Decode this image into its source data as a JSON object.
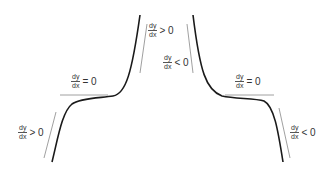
{
  "diagram": {
    "title": "",
    "colors": {
      "curve": "#1a1a1a",
      "tangent": "#888888",
      "text": "#333333"
    },
    "labels": [
      {
        "id": "left-lower",
        "numerator": "dy",
        "denominator": "dx",
        "relation": "> 0"
      },
      {
        "id": "left-flat",
        "numerator": "dy",
        "denominator": "dx",
        "relation": "= 0"
      },
      {
        "id": "left-upper",
        "numerator": "dy",
        "denominator": "dx",
        "relation": "> 0"
      },
      {
        "id": "right-upper",
        "numerator": "dy",
        "denominator": "dx",
        "relation": "< 0"
      },
      {
        "id": "right-flat",
        "numerator": "dy",
        "denominator": "dx",
        "relation": "= 0"
      },
      {
        "id": "right-lower",
        "numerator": "dy",
        "denominator": "dx",
        "relation": "< 0"
      }
    ],
    "curves": [
      {
        "name": "increasing-inflection-curve",
        "description": "stationary point of inflection, increasing"
      },
      {
        "name": "decreasing-inflection-curve",
        "description": "stationary point of inflection, decreasing"
      }
    ]
  }
}
